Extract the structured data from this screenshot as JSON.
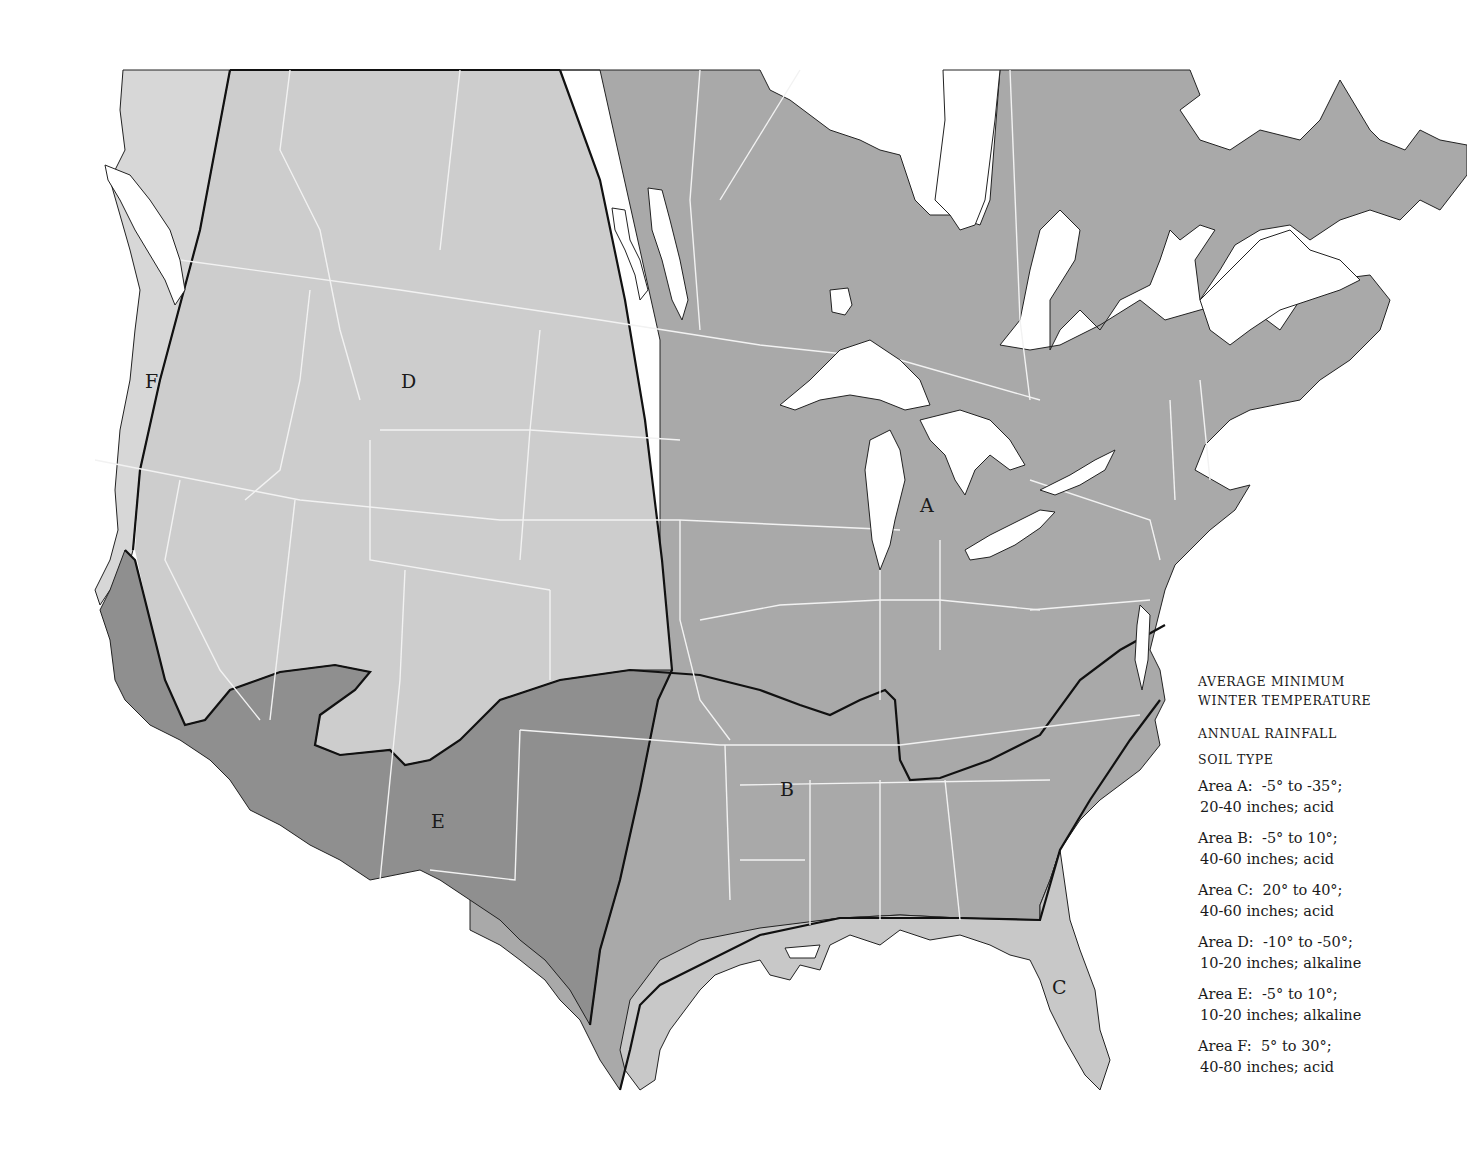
{
  "legend": {
    "heading_line1": "AVERAGE MINIMUM",
    "heading_line2": "WINTER TEMPERATURE",
    "heading_rainfall": "ANNUAL RAINFALL",
    "heading_soil": "SOIL TYPE",
    "entries": [
      {
        "area": "Area A:",
        "temperature": "-5° to -35°;",
        "rainfall_soil": "20-40 inches; acid"
      },
      {
        "area": "Area B:",
        "temperature": "-5° to 10°;",
        "rainfall_soil": "40-60 inches; acid"
      },
      {
        "area": "Area C:",
        "temperature": "20° to 40°;",
        "rainfall_soil": "40-60 inches; acid"
      },
      {
        "area": "Area D:",
        "temperature": "-10° to -50°;",
        "rainfall_soil": "10-20 inches; alkaline"
      },
      {
        "area": "Area E:",
        "temperature": "-5° to 10°;",
        "rainfall_soil": "10-20 inches; alkaline"
      },
      {
        "area": "Area F:",
        "temperature": "5° to 30°;",
        "rainfall_soil": "40-80 inches; acid"
      }
    ]
  },
  "map": {
    "zone_labels": {
      "A": "A",
      "B": "B",
      "C": "C",
      "D": "D",
      "E": "E",
      "F": "F"
    },
    "colors": {
      "zone_light": "#d4d4d4",
      "zone_D": "#cdcdcd",
      "zone_mid": "#a9a9a9",
      "zone_E": "#8f8f8f",
      "zone_C": "#c8c8c8",
      "water": "#ffffff",
      "boundary_lines": "#f2f2f2",
      "zone_borders": "#111111"
    }
  }
}
